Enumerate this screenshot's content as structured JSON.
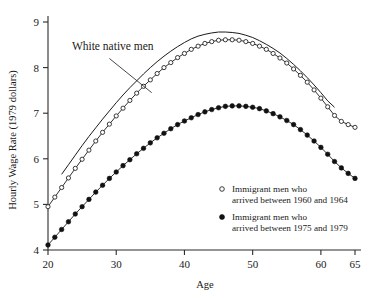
{
  "chart_data": {
    "type": "line",
    "title": "",
    "xlabel": "Age",
    "ylabel": "Hourly Wage Rate (1979 dollars)",
    "xlim": [
      20,
      65
    ],
    "ylim": [
      4,
      9
    ],
    "xticks": [
      20,
      30,
      40,
      50,
      60,
      65
    ],
    "yticks": [
      4,
      5,
      6,
      7,
      8,
      9
    ],
    "xtick_labels": [
      "20",
      "30",
      "40",
      "50",
      "60",
      "65"
    ],
    "ytick_labels": [
      "4",
      "5",
      "6",
      "7",
      "8",
      "9"
    ],
    "grid": false,
    "legend_position": "inside-lower-right",
    "annotations": [
      {
        "text": "White native men",
        "text_x": 23.5,
        "text_y": 8.38,
        "leader_from": [
          29.0,
          8.2
        ],
        "leader_to": [
          35.2,
          7.45
        ]
      }
    ],
    "series": [
      {
        "name": "White native men",
        "marker": "none",
        "style": "plain-curve",
        "x": [
          22,
          23,
          24,
          25,
          26,
          27,
          28,
          29,
          30,
          31,
          32,
          33,
          34,
          35,
          36,
          37,
          38,
          39,
          40,
          41,
          42,
          43,
          44,
          45,
          46,
          47,
          48,
          49,
          50,
          51,
          52,
          53,
          54,
          55,
          56,
          57,
          58,
          59,
          60,
          61,
          62
        ],
        "values": [
          5.66,
          5.87,
          6.08,
          6.29,
          6.49,
          6.68,
          6.87,
          7.05,
          7.23,
          7.4,
          7.56,
          7.71,
          7.86,
          8.0,
          8.13,
          8.25,
          8.36,
          8.46,
          8.55,
          8.63,
          8.69,
          8.73,
          8.76,
          8.78,
          8.78,
          8.77,
          8.75,
          8.71,
          8.66,
          8.59,
          8.51,
          8.42,
          8.32,
          8.2,
          8.07,
          7.93,
          7.78,
          7.62,
          7.45,
          7.27,
          7.13
        ]
      },
      {
        "name": "Immigrant men who arrived between 1960 and 1964",
        "marker": "open-circle",
        "x": [
          20,
          21,
          22,
          23,
          24,
          25,
          26,
          27,
          28,
          29,
          30,
          31,
          32,
          33,
          34,
          35,
          36,
          37,
          38,
          39,
          40,
          41,
          42,
          43,
          44,
          45,
          46,
          47,
          48,
          49,
          50,
          51,
          52,
          53,
          54,
          55,
          56,
          57,
          58,
          59,
          60,
          61,
          62,
          63,
          64,
          65
        ],
        "values": [
          4.95,
          5.16,
          5.37,
          5.58,
          5.79,
          5.99,
          6.19,
          6.39,
          6.58,
          6.76,
          6.94,
          7.11,
          7.28,
          7.44,
          7.59,
          7.73,
          7.87,
          8.0,
          8.11,
          8.22,
          8.31,
          8.4,
          8.47,
          8.53,
          8.57,
          8.6,
          8.61,
          8.61,
          8.6,
          8.57,
          8.53,
          8.47,
          8.4,
          8.31,
          8.21,
          8.1,
          7.97,
          7.83,
          7.68,
          7.51,
          7.33,
          7.14,
          6.95,
          6.82,
          6.75,
          6.69
        ]
      },
      {
        "name": "Immigrant men who arrived between 1975 and 1979",
        "marker": "filled-circle",
        "x": [
          20,
          21,
          22,
          23,
          24,
          25,
          26,
          27,
          28,
          29,
          30,
          31,
          32,
          33,
          34,
          35,
          36,
          37,
          38,
          39,
          40,
          41,
          42,
          43,
          44,
          45,
          46,
          47,
          48,
          49,
          50,
          51,
          52,
          53,
          54,
          55,
          56,
          57,
          58,
          59,
          60,
          61,
          62,
          63,
          64,
          65
        ],
        "values": [
          4.11,
          4.28,
          4.45,
          4.62,
          4.79,
          4.95,
          5.11,
          5.27,
          5.42,
          5.57,
          5.71,
          5.85,
          5.98,
          6.11,
          6.23,
          6.35,
          6.46,
          6.56,
          6.66,
          6.75,
          6.83,
          6.9,
          6.97,
          7.03,
          7.08,
          7.12,
          7.15,
          7.16,
          7.16,
          7.15,
          7.13,
          7.1,
          7.05,
          6.99,
          6.92,
          6.84,
          6.75,
          6.64,
          6.52,
          6.39,
          6.25,
          6.1,
          5.94,
          5.8,
          5.68,
          5.57
        ]
      }
    ],
    "legend": [
      {
        "marker": "open-circle",
        "line1": "Immigrant men who",
        "line2": "arrived between 1960 and 1964"
      },
      {
        "marker": "filled-circle",
        "line1": "Immigrant men who",
        "line2": "arrived between 1975 and 1979"
      }
    ],
    "colors": {
      "axis": "#2b2b2b",
      "ink": "#1a1a1a",
      "background": "#ffffff",
      "marker_open_fill": "#ffffff"
    }
  }
}
